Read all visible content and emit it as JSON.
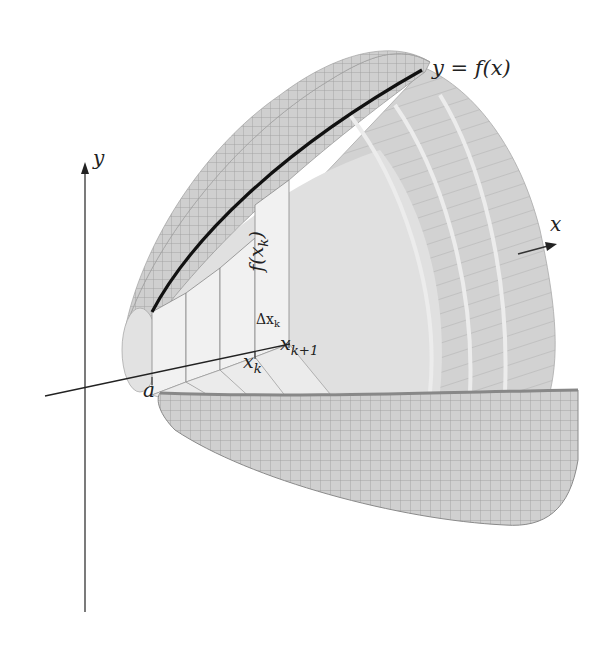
{
  "figure": {
    "labels": {
      "curve": "y = f(x)",
      "y_axis": "y",
      "x_axis": "x",
      "left_bound": "a",
      "xk": "x",
      "xk_sub": "k",
      "xk1": "x",
      "xk1_sub": "k+1",
      "dx": "Δx",
      "dx_sub": "k",
      "height": "f(x",
      "height_sub": "k",
      "height_close": ")"
    },
    "colors": {
      "background": "#ffffff",
      "surface": "#d4d4d4",
      "surface_inner": "#e2e2e2",
      "grid": "#9a9a9a",
      "rect_fill": "#efefef",
      "curve": "#111111",
      "axis": "#333333"
    }
  }
}
